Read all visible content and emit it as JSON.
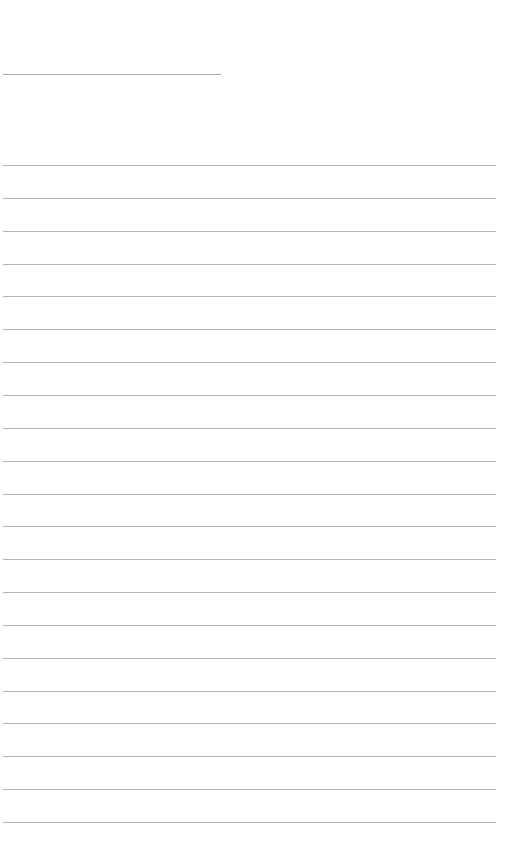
{
  "document": {
    "type": "blank lined paper",
    "title_line": {
      "x": 3,
      "y": 74,
      "width": 218,
      "color": "#a9a9a9"
    },
    "ruled_lines": {
      "count": 21,
      "first_y": 165,
      "spacing": 32.85,
      "x": 3,
      "width": 493,
      "color": "#b4b4b4"
    }
  }
}
